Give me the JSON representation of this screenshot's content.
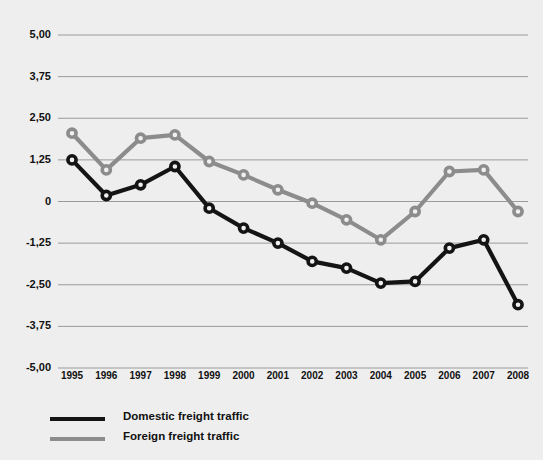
{
  "chart_data": {
    "type": "line",
    "title": "",
    "subtitle": "",
    "xlabel": "",
    "ylabel": "",
    "grid": true,
    "legend_position": "bottom-left",
    "categories": [
      "1995",
      "1996",
      "1997",
      "1998",
      "1999",
      "2000",
      "2001",
      "2002",
      "2003",
      "2004",
      "2005",
      "2006",
      "2007",
      "2008"
    ],
    "ylim": [
      -5.0,
      5.0
    ],
    "ytick_labels": [
      "5,00",
      "3,75",
      "2,50",
      "1,25",
      "0",
      "-1,25",
      "-2,50",
      "-3,75",
      "-5,00"
    ],
    "ytick_values": [
      5.0,
      3.75,
      2.5,
      1.25,
      0,
      -1.25,
      -2.5,
      -3.75,
      -5.0
    ],
    "series": [
      {
        "name": "Domestic freight traffic",
        "color": "#141414",
        "marker": "circle-open",
        "values": [
          1.25,
          0.18,
          0.5,
          1.05,
          -0.2,
          -0.8,
          -1.25,
          -1.8,
          -2.0,
          -2.45,
          -2.4,
          -1.4,
          -1.15,
          -3.1
        ]
      },
      {
        "name": "Foreign freight traffic",
        "color": "#8c8c8c",
        "marker": "circle-open",
        "values": [
          2.05,
          0.95,
          1.9,
          2.0,
          1.2,
          0.8,
          0.35,
          -0.05,
          -0.55,
          -1.15,
          -0.3,
          0.9,
          0.95,
          -0.3
        ]
      }
    ]
  },
  "legend": {
    "items": [
      {
        "label": "Domestic freight traffic",
        "color": "#141414"
      },
      {
        "label": "Foreign freight traffic",
        "color": "#8c8c8c"
      }
    ]
  }
}
